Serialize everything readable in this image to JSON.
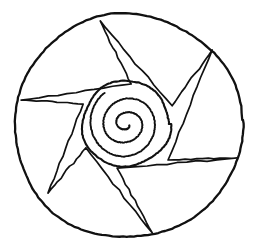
{
  "artwork": {
    "title": "Spiral Mandala Line Drawing",
    "description": "Hand-drawn black ink mandala: an outer circle enclosing a six-pointed pinwheel star whose inner vertices rest on a central spiral disc",
    "style": "hand-drawn ink line art",
    "background_color": "#ffffff",
    "ink_color": "#111111",
    "canvas": {
      "width": 258,
      "height": 250
    }
  },
  "chart_data": {
    "type": "scatter",
    "title": "Spiral Mandala Line Drawing",
    "xlabel": "",
    "ylabel": "",
    "xlim": [
      0,
      258
    ],
    "ylim": [
      0,
      250
    ],
    "grid": false,
    "legend": "none"
  },
  "geometry": {
    "outer_circle": {
      "label": "Outer Circle",
      "center_x": 128,
      "center_y": 126,
      "radius_x": 114,
      "radius_y": 112,
      "stroke_width": 2.3,
      "rotation_deg": -3
    },
    "spiral_disc": {
      "label": "Spiral Outer Ring",
      "center_x": 126,
      "center_y": 124,
      "radius": 44,
      "stroke_width": 2.1
    },
    "spiral": {
      "label": "Archimedean Spiral",
      "center_x": 126,
      "center_y": 124,
      "turns": 2.6,
      "start_radius": 3,
      "end_radius": 38,
      "start_angle_deg": 20,
      "stroke_width": 1.9
    },
    "star": {
      "label": "Six-Pointed Pinwheel Star",
      "points": 6,
      "stroke_width": 1.7,
      "outer_vertices": [
        {
          "name": "point-top",
          "x": 100,
          "y": 21
        },
        {
          "name": "point-upper-right",
          "x": 212,
          "y": 50
        },
        {
          "name": "point-right",
          "x": 237,
          "y": 158
        },
        {
          "name": "point-bottom",
          "x": 152,
          "y": 233
        },
        {
          "name": "point-lower-left",
          "x": 48,
          "y": 193
        },
        {
          "name": "point-left",
          "x": 21,
          "y": 100
        }
      ],
      "inner_vertices": [
        {
          "name": "inner-upper-right",
          "x": 172,
          "y": 106
        },
        {
          "name": "inner-right",
          "x": 168,
          "y": 160
        },
        {
          "name": "inner-lower",
          "x": 117,
          "y": 168
        },
        {
          "name": "inner-lower-left",
          "x": 86,
          "y": 148
        },
        {
          "name": "inner-left",
          "x": 83,
          "y": 104
        },
        {
          "name": "inner-upper",
          "x": 131,
          "y": 84
        }
      ]
    }
  }
}
